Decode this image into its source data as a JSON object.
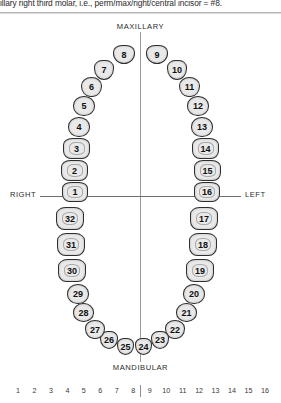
{
  "caption": {
    "text": "illary right third molar, i.e., perm/max/right/central incisor = #8."
  },
  "labels": {
    "maxillary": "MAXILLARY",
    "mandibular": "MANDIBULAR",
    "right": "RIGHT",
    "left": "LEFT"
  },
  "colors": {
    "tooth_fill": "#e9e9e9",
    "tooth_outline": "#2e2e2e",
    "guide_line": "#6e6e6e",
    "text": "#1a1a1a"
  },
  "chart_data": {
    "type": "diagram",
    "notation": "Universal",
    "arches": [
      {
        "name": "maxillary",
        "label": "MAXILLARY",
        "tooth_range": [
          1,
          16
        ]
      },
      {
        "name": "mandibular",
        "label": "MANDIBULAR",
        "tooth_range": [
          17,
          32
        ]
      }
    ],
    "teeth": [
      {
        "number": "1",
        "arch": "maxillary",
        "quadrant": "upper-right",
        "type": "molar",
        "x": 62,
        "y": 182,
        "w": 26,
        "h": 20
      },
      {
        "number": "2",
        "arch": "maxillary",
        "quadrant": "upper-right",
        "type": "molar",
        "x": 61,
        "y": 160,
        "w": 27,
        "h": 21
      },
      {
        "number": "3",
        "arch": "maxillary",
        "quadrant": "upper-right",
        "type": "molar",
        "x": 63,
        "y": 138,
        "w": 27,
        "h": 21
      },
      {
        "number": "4",
        "arch": "maxillary",
        "quadrant": "upper-right",
        "type": "premolar",
        "x": 68,
        "y": 117,
        "w": 22,
        "h": 20
      },
      {
        "number": "5",
        "arch": "maxillary",
        "quadrant": "upper-right",
        "type": "premolar",
        "x": 73,
        "y": 96,
        "w": 22,
        "h": 20
      },
      {
        "number": "6",
        "arch": "maxillary",
        "quadrant": "upper-right",
        "type": "canine",
        "x": 81,
        "y": 77,
        "w": 21,
        "h": 20
      },
      {
        "number": "7",
        "arch": "maxillary",
        "quadrant": "upper-right",
        "type": "incisor",
        "x": 94,
        "y": 60,
        "w": 20,
        "h": 20
      },
      {
        "number": "8",
        "arch": "maxillary",
        "quadrant": "upper-right",
        "type": "incisor",
        "x": 113,
        "y": 45,
        "w": 22,
        "h": 19
      },
      {
        "number": "9",
        "arch": "maxillary",
        "quadrant": "upper-left",
        "type": "incisor",
        "x": 146,
        "y": 45,
        "w": 22,
        "h": 19
      },
      {
        "number": "10",
        "arch": "maxillary",
        "quadrant": "upper-left",
        "type": "incisor",
        "x": 167,
        "y": 60,
        "w": 20,
        "h": 20
      },
      {
        "number": "11",
        "arch": "maxillary",
        "quadrant": "upper-left",
        "type": "canine",
        "x": 179,
        "y": 77,
        "w": 21,
        "h": 20
      },
      {
        "number": "12",
        "arch": "maxillary",
        "quadrant": "upper-left",
        "type": "premolar",
        "x": 187,
        "y": 96,
        "w": 22,
        "h": 20
      },
      {
        "number": "13",
        "arch": "maxillary",
        "quadrant": "upper-left",
        "type": "premolar",
        "x": 191,
        "y": 117,
        "w": 22,
        "h": 20
      },
      {
        "number": "14",
        "arch": "maxillary",
        "quadrant": "upper-left",
        "type": "molar",
        "x": 192,
        "y": 138,
        "w": 27,
        "h": 21
      },
      {
        "number": "15",
        "arch": "maxillary",
        "quadrant": "upper-left",
        "type": "molar",
        "x": 194,
        "y": 160,
        "w": 27,
        "h": 21
      },
      {
        "number": "16",
        "arch": "maxillary",
        "quadrant": "upper-left",
        "type": "molar",
        "x": 194,
        "y": 182,
        "w": 26,
        "h": 20
      },
      {
        "number": "17",
        "arch": "mandibular",
        "quadrant": "lower-left",
        "type": "molar",
        "x": 190,
        "y": 207,
        "w": 28,
        "h": 23
      },
      {
        "number": "18",
        "arch": "mandibular",
        "quadrant": "lower-left",
        "type": "molar",
        "x": 189,
        "y": 233,
        "w": 28,
        "h": 23
      },
      {
        "number": "19",
        "arch": "mandibular",
        "quadrant": "lower-left",
        "type": "molar",
        "x": 186,
        "y": 259,
        "w": 28,
        "h": 23
      },
      {
        "number": "20",
        "arch": "mandibular",
        "quadrant": "lower-left",
        "type": "premolar",
        "x": 183,
        "y": 284,
        "w": 22,
        "h": 20
      },
      {
        "number": "21",
        "arch": "mandibular",
        "quadrant": "lower-left",
        "type": "premolar",
        "x": 176,
        "y": 303,
        "w": 21,
        "h": 19
      },
      {
        "number": "22",
        "arch": "mandibular",
        "quadrant": "lower-left",
        "type": "canine",
        "x": 165,
        "y": 320,
        "w": 20,
        "h": 19
      },
      {
        "number": "23",
        "arch": "mandibular",
        "quadrant": "lower-left",
        "type": "incisor",
        "x": 151,
        "y": 331,
        "w": 18,
        "h": 18
      },
      {
        "number": "24",
        "arch": "mandibular",
        "quadrant": "lower-left",
        "type": "incisor",
        "x": 135,
        "y": 338,
        "w": 17,
        "h": 17
      },
      {
        "number": "25",
        "arch": "mandibular",
        "quadrant": "lower-right",
        "type": "incisor",
        "x": 117,
        "y": 338,
        "w": 17,
        "h": 17
      },
      {
        "number": "26",
        "arch": "mandibular",
        "quadrant": "lower-right",
        "type": "incisor",
        "x": 100,
        "y": 331,
        "w": 18,
        "h": 18
      },
      {
        "number": "27",
        "arch": "mandibular",
        "quadrant": "lower-right",
        "type": "canine",
        "x": 85,
        "y": 320,
        "w": 20,
        "h": 19
      },
      {
        "number": "28",
        "arch": "mandibular",
        "quadrant": "lower-right",
        "type": "premolar",
        "x": 73,
        "y": 303,
        "w": 21,
        "h": 19
      },
      {
        "number": "29",
        "arch": "mandibular",
        "quadrant": "lower-right",
        "type": "premolar",
        "x": 67,
        "y": 284,
        "w": 22,
        "h": 20
      },
      {
        "number": "30",
        "arch": "mandibular",
        "quadrant": "lower-right",
        "type": "molar",
        "x": 58,
        "y": 259,
        "w": 28,
        "h": 23
      },
      {
        "number": "31",
        "arch": "mandibular",
        "quadrant": "lower-right",
        "type": "molar",
        "x": 57,
        "y": 233,
        "w": 28,
        "h": 23
      },
      {
        "number": "32",
        "arch": "mandibular",
        "quadrant": "lower-right",
        "type": "molar",
        "x": 56,
        "y": 207,
        "w": 28,
        "h": 23
      }
    ]
  },
  "ruler": {
    "ticks": [
      "1",
      "2",
      "3",
      "4",
      "5",
      "6",
      "7",
      "8",
      "9",
      "10",
      "11",
      "12",
      "13",
      "14",
      "15",
      "16"
    ],
    "divider_after": "8"
  }
}
